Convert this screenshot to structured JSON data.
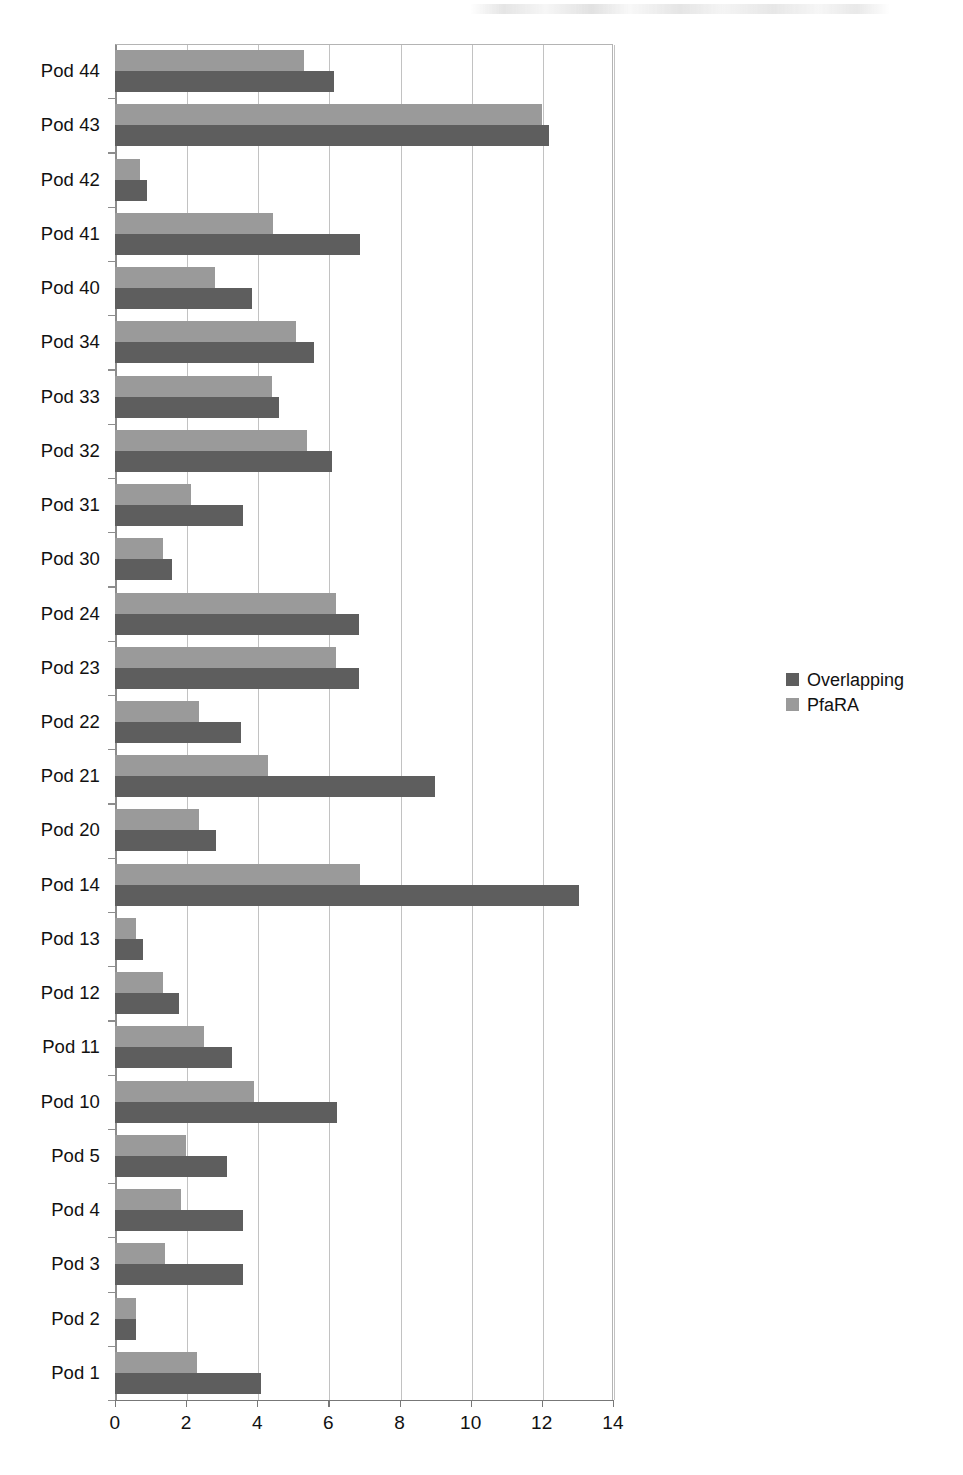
{
  "chart_data": {
    "type": "bar",
    "orientation": "horizontal",
    "title": "",
    "subtitle": "",
    "xlabel": "",
    "ylabel": "",
    "xlim": [
      0,
      14
    ],
    "ylim": null,
    "grid": true,
    "grid_axis": "x",
    "legend_position": "right",
    "xticks": [
      0,
      2,
      4,
      6,
      8,
      10,
      12,
      14
    ],
    "xtick_labels": [
      "0",
      "2",
      "4",
      "6",
      "8",
      "10",
      "12",
      "14"
    ],
    "categories": [
      "Pod 44",
      "Pod 43",
      "Pod 42",
      "Pod 41",
      "Pod 40",
      "Pod 34",
      "Pod 33",
      "Pod 32",
      "Pod 31",
      "Pod 30",
      "Pod 24",
      "Pod 23",
      "Pod 22",
      "Pod 21",
      "Pod 20",
      "Pod 14",
      "Pod 13",
      "Pod 12",
      "Pod 11",
      "Pod 10",
      "Pod 5",
      "Pod 4",
      "Pod 3",
      "Pod 2",
      "Pod 1"
    ],
    "series": [
      {
        "name": "Overlapping",
        "color": "#5e5e5e",
        "values": [
          6.15,
          12.2,
          0.9,
          6.9,
          3.85,
          5.6,
          4.6,
          6.1,
          3.6,
          1.6,
          6.85,
          6.85,
          3.55,
          9.0,
          2.85,
          13.05,
          0.8,
          1.8,
          3.3,
          6.25,
          3.15,
          3.6,
          3.6,
          0.6,
          4.1
        ]
      },
      {
        "name": "PfaRA",
        "color": "#9a9a9a",
        "values": [
          5.3,
          12.0,
          0.7,
          4.45,
          2.8,
          5.1,
          4.4,
          5.4,
          2.15,
          1.35,
          6.2,
          6.2,
          2.35,
          4.3,
          2.35,
          6.9,
          0.6,
          1.35,
          2.5,
          3.9,
          2.0,
          1.85,
          1.4,
          0.6,
          2.3
        ]
      }
    ]
  },
  "legend": {
    "entries": [
      {
        "label": "Overlapping",
        "color": "#5e5e5e",
        "swatch_name": "legend-swatch-overlapping"
      },
      {
        "label": "PfaRA",
        "color": "#9a9a9a",
        "swatch_name": "legend-swatch-pfara"
      }
    ]
  },
  "colors": {
    "overlapping": "#5e5e5e",
    "pfara": "#9a9a9a",
    "gridline": "#c2c2c2",
    "axis": "#777777",
    "text": "#111111",
    "background": "#ffffff"
  }
}
